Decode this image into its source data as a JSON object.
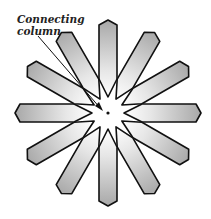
{
  "diagram": {
    "label_line1": "Connecting",
    "label_line2": "column",
    "arm_count": 12,
    "colors": {
      "stroke": "#111111",
      "fill_light": "#f4f4f4",
      "fill_dark": "#a9a9a9",
      "background": "#ffffff"
    }
  }
}
